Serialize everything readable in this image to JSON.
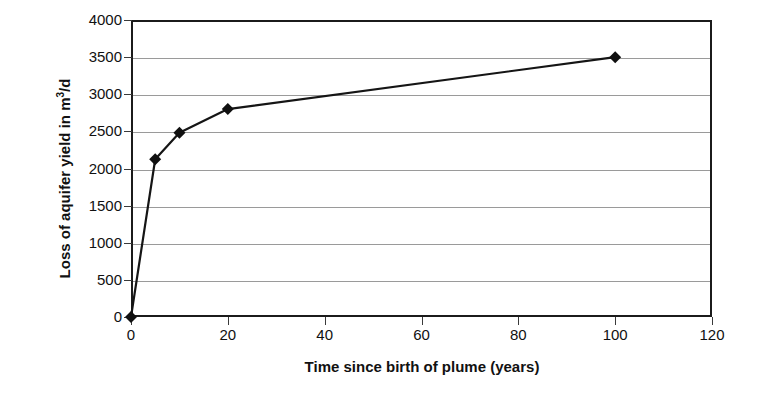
{
  "chart_data": {
    "type": "line",
    "title": "",
    "xlabel": "Time since birth of plume (years)",
    "ylabel": "Loss of aquifer yield in m3/d",
    "ylabel_parts": {
      "pre": "Loss of aquifer yield in m",
      "sup": "3",
      "post": "/d"
    },
    "x": [
      0,
      5,
      10,
      20,
      100
    ],
    "values": [
      0,
      2125,
      2480,
      2800,
      3500
    ],
    "series": [
      {
        "name": "Loss of aquifer yield",
        "points": [
          {
            "x": 0,
            "y": 0
          },
          {
            "x": 5,
            "y": 2125
          },
          {
            "x": 10,
            "y": 2480
          },
          {
            "x": 20,
            "y": 2800
          },
          {
            "x": 100,
            "y": 3500
          }
        ]
      }
    ],
    "xlim": [
      0,
      120
    ],
    "ylim": [
      0,
      4000
    ],
    "xticks": [
      0,
      20,
      40,
      60,
      80,
      100,
      120
    ],
    "yticks": [
      0,
      500,
      1000,
      1500,
      2000,
      2500,
      3000,
      3500,
      4000
    ],
    "xtick_labels": [
      "0",
      "20",
      "40",
      "60",
      "80",
      "100",
      "120"
    ],
    "ytick_labels": [
      "0",
      "500",
      "1000",
      "1500",
      "2000",
      "2500",
      "3000",
      "3500",
      "4000"
    ],
    "grid": {
      "horizontal": true,
      "vertical": false
    },
    "legend": {
      "visible": false,
      "position": "none"
    },
    "marker": "diamond",
    "colors": {
      "line": "#151515",
      "marker": "#101010",
      "grid": "#9a9a9a",
      "frame": "#1b1b1b",
      "background": "#ffffff",
      "text": "#111111"
    }
  }
}
